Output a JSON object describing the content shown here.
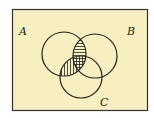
{
  "diagram": {
    "type": "venn",
    "background_color": "#f7efbf",
    "frame_color": "#333333",
    "sets": [
      {
        "label": "A",
        "cx": 64,
        "cy": 54,
        "r": 22,
        "label_x": 19,
        "label_y": 35
      },
      {
        "label": "B",
        "cx": 95,
        "cy": 56,
        "r": 22,
        "label_x": 127,
        "label_y": 35
      },
      {
        "label": "C",
        "cx": 81,
        "cy": 77,
        "r": 21,
        "label_x": 100,
        "label_y": 106
      }
    ],
    "shaded_regions": [
      {
        "region": "A∩B",
        "pattern": "horizontal-stripes"
      },
      {
        "region": "A∩C",
        "pattern": "vertical-stripes"
      }
    ]
  }
}
